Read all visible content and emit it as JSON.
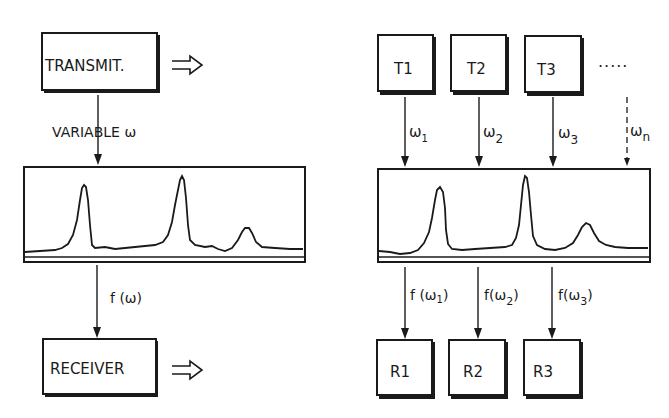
{
  "left": {
    "transmitter_label": "TRANSMIT.",
    "variable_label": "VARIABLE ω",
    "output_label": "f (ω)",
    "receiver_label": "RECEIVER",
    "arrow_glyph": "⇒"
  },
  "right": {
    "transmitters": [
      {
        "label": "T1",
        "freq": "ω",
        "sub": "1"
      },
      {
        "label": "T2",
        "freq": "ω",
        "sub": "2"
      },
      {
        "label": "T3",
        "freq": "ω",
        "sub": "3"
      }
    ],
    "ellipsis": "·····",
    "last_freq": {
      "freq": "ω",
      "sub": "n"
    },
    "receivers": [
      {
        "label": "R1",
        "out": "f (ω",
        "sub": "1",
        "close": ")"
      },
      {
        "label": "R2",
        "out": "f(ω",
        "sub": "2",
        "close": ")"
      },
      {
        "label": "R3",
        "out": "f(ω",
        "sub": "3",
        "close": ")"
      }
    ]
  },
  "colors": {
    "ink": "#1a1a1a",
    "background": "#ffffff"
  }
}
